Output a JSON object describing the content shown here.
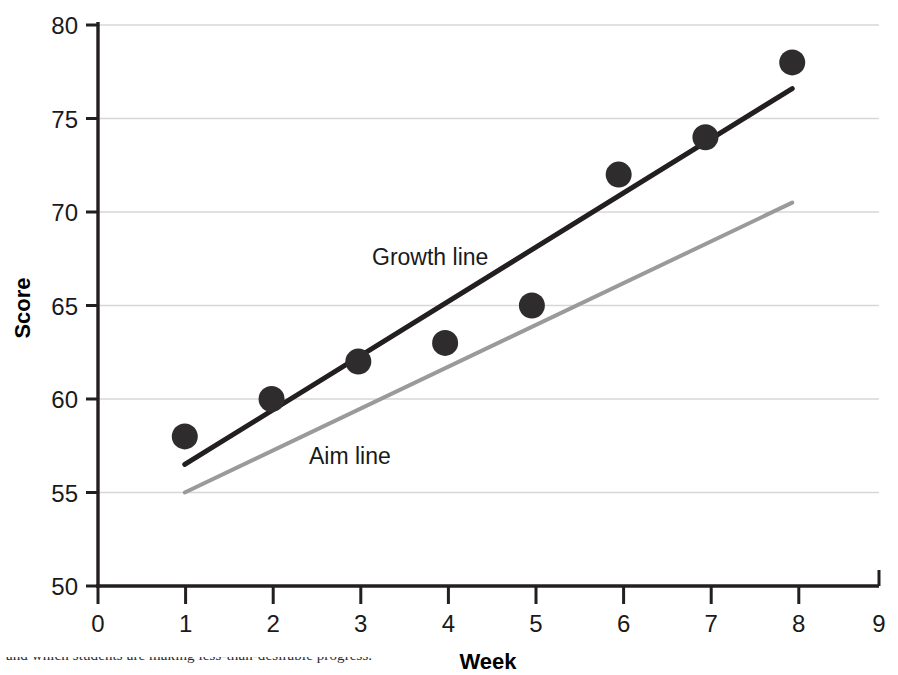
{
  "chart_data": {
    "type": "scatter",
    "title": "",
    "xlabel": "Week",
    "ylabel": "Score",
    "xlim": [
      0,
      9
    ],
    "ylim": [
      50,
      80
    ],
    "x_ticks": [
      "0",
      "1",
      "2",
      "3",
      "4",
      "5",
      "6",
      "7",
      "8",
      "9"
    ],
    "y_ticks": [
      "50",
      "55",
      "60",
      "65",
      "70",
      "75",
      "80"
    ],
    "grid": "horizontal",
    "legend_position": "inline-annotations",
    "x": [
      1,
      2,
      3,
      4,
      5,
      6,
      7,
      8
    ],
    "values": [
      58,
      60,
      62,
      63,
      65,
      72,
      74,
      78
    ],
    "points_label": "Weekly score",
    "series": [
      {
        "name": "Growth line",
        "type": "line",
        "x": [
          1,
          8
        ],
        "values": [
          56.5,
          76.6
        ],
        "color": "#231f20"
      },
      {
        "name": "Aim line",
        "type": "line",
        "x": [
          1,
          8
        ],
        "values": [
          55.0,
          70.5
        ],
        "color": "#9a9a9a"
      }
    ],
    "annotations": [
      {
        "text": "Growth line",
        "x": 4.1,
        "y": 66.7
      },
      {
        "text": "Aim line",
        "x": 3.5,
        "y": 57.0
      }
    ]
  },
  "style": {
    "point_color": "#2e2c2d",
    "axis_color": "#231f20",
    "grid_color": "#d7d7d7",
    "background": "#ffffff"
  },
  "caption": {
    "text": "and which students are making less-than-desirable progress."
  }
}
